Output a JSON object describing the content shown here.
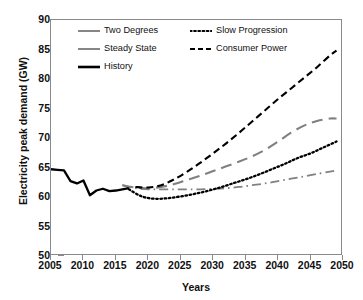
{
  "chart_data": {
    "type": "line",
    "title": "",
    "xlabel": "Years",
    "ylabel": "Electricity peak demand (GW)",
    "xlim": [
      2005,
      2050
    ],
    "ylim": [
      50,
      90
    ],
    "xticks": [
      2005,
      2010,
      2015,
      2020,
      2025,
      2030,
      2035,
      2040,
      2045,
      2050
    ],
    "yticks": [
      50,
      55,
      60,
      65,
      70,
      75,
      80,
      85,
      90
    ],
    "grid": false,
    "legend_position": "upper-left-inside",
    "units": "GW",
    "series": [
      {
        "name": "Two Degrees",
        "style": "long-dashed",
        "color": "#808080",
        "x": [
          2016,
          2018,
          2020,
          2022,
          2024,
          2026,
          2028,
          2030,
          2032,
          2034,
          2036,
          2038,
          2040,
          2042,
          2044,
          2046,
          2048,
          2049
        ],
        "values": [
          62.0,
          61.6,
          61.5,
          61.7,
          62.2,
          62.9,
          63.6,
          64.4,
          65.2,
          66.0,
          66.9,
          68.0,
          69.4,
          70.9,
          72.1,
          72.9,
          73.3,
          73.3
        ]
      },
      {
        "name": "Steady State",
        "style": "dash-dot",
        "color": "#808080",
        "x": [
          2016,
          2018,
          2020,
          2022,
          2024,
          2026,
          2028,
          2030,
          2032,
          2034,
          2036,
          2038,
          2040,
          2042,
          2044,
          2046,
          2048,
          2049
        ],
        "values": [
          62.0,
          61.5,
          61.3,
          61.3,
          61.3,
          61.3,
          61.3,
          61.4,
          61.5,
          61.7,
          62.0,
          62.3,
          62.7,
          63.1,
          63.5,
          63.9,
          64.3,
          64.5
        ]
      },
      {
        "name": "History",
        "style": "solid",
        "color": "#000000",
        "x": [
          2005,
          2006,
          2007,
          2008,
          2009,
          2010,
          2011,
          2012,
          2013,
          2014,
          2015,
          2016,
          2017
        ],
        "values": [
          64.7,
          64.6,
          64.5,
          62.7,
          62.3,
          62.8,
          60.3,
          61.1,
          61.4,
          61.0,
          61.1,
          61.3,
          61.5
        ]
      },
      {
        "name": "Slow Progression",
        "style": "dotted",
        "color": "#000000",
        "x": [
          2017,
          2019,
          2021,
          2023,
          2025,
          2027,
          2029,
          2031,
          2033,
          2035,
          2037,
          2039,
          2041,
          2043,
          2045,
          2047,
          2049
        ],
        "values": [
          61.3,
          60.1,
          59.7,
          59.8,
          60.1,
          60.5,
          61.0,
          61.6,
          62.3,
          63.0,
          63.8,
          64.7,
          65.6,
          66.6,
          67.4,
          68.4,
          69.4
        ]
      },
      {
        "name": "Consumer Power",
        "style": "dashed",
        "color": "#000000",
        "x": [
          2018,
          2020,
          2022,
          2024,
          2026,
          2028,
          2030,
          2032,
          2034,
          2036,
          2038,
          2040,
          2042,
          2044,
          2046,
          2048,
          2049
        ],
        "values": [
          61.7,
          61.6,
          62.0,
          63.0,
          64.3,
          65.8,
          67.4,
          69.1,
          70.9,
          72.8,
          74.7,
          76.6,
          78.4,
          80.2,
          82.0,
          84.0,
          84.8
        ]
      }
    ]
  },
  "legend": {
    "entries": [
      {
        "label": "Two Degrees"
      },
      {
        "label": "Steady State"
      },
      {
        "label": "History"
      },
      {
        "label": "Slow Progression"
      },
      {
        "label": "Consumer Power"
      }
    ]
  },
  "axes": {
    "x_title": "Years",
    "y_title": "Electricity peak demand (GW)",
    "x_ticks": [
      "2005",
      "2010",
      "2015",
      "2020",
      "2025",
      "2030",
      "2035",
      "2040",
      "2045",
      "2050"
    ],
    "y_ticks": [
      "90",
      "85",
      "80",
      "75",
      "70",
      "65",
      "60",
      "55",
      "50"
    ]
  },
  "colors": {
    "gray_series": "#808080",
    "black_series": "#000000",
    "frame": "#8a8a8a",
    "background": "#ffffff"
  }
}
